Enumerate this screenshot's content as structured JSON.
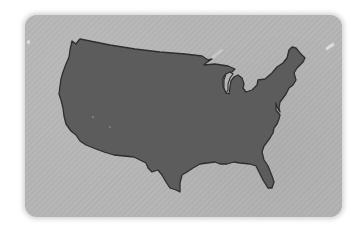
{
  "image": {
    "subject": "United States map silhouette",
    "map_label": "contiguous-united-states",
    "colors": {
      "background": "#ffffff",
      "card": "#b5b5b5",
      "map_fill": "#5c5c5c",
      "map_stroke": "#2e2e2e"
    }
  }
}
